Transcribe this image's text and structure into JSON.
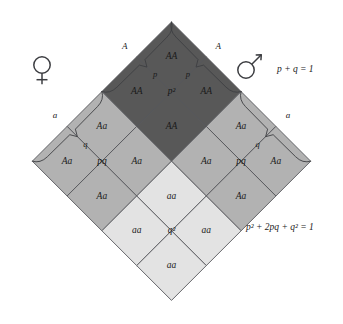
{
  "diagram": {
    "colors": {
      "dark": "#585858",
      "medium": "#b2b2b2",
      "light": "#e3e3e3",
      "stroke": "#55565a",
      "bracket": "#3d3e42",
      "text": "#1a1a1a",
      "background": "#ffffff"
    },
    "symbols": {
      "female": "female-symbol",
      "male": "male-symbol"
    },
    "equations": {
      "allele": "p + q = 1",
      "genotype": "p² + 2pq + q² = 1"
    },
    "brackets": {
      "female_p": "p",
      "female_q": "q",
      "male_p": "p",
      "male_q": "q"
    },
    "allele_labels": {
      "female_A": "A",
      "female_a": "a",
      "male_A": "A",
      "male_a": "a"
    },
    "quadrants": [
      {
        "name": "top",
        "center_label": "p²",
        "shade": "dark",
        "cells": [
          "AA",
          "AA",
          "AA",
          "AA"
        ]
      },
      {
        "name": "left",
        "center_label": "pq",
        "shade": "medium",
        "cells": [
          "Aa",
          "Aa",
          "Aa",
          "Aa"
        ]
      },
      {
        "name": "right",
        "center_label": "pq",
        "shade": "medium",
        "cells": [
          "Aa",
          "Aa",
          "Aa",
          "Aa"
        ]
      },
      {
        "name": "bottom",
        "center_label": "q²",
        "shade": "light",
        "cells": [
          "aa",
          "aa",
          "aa",
          "aa"
        ]
      }
    ],
    "grid_cells": [
      {
        "row": 0,
        "col": 0,
        "label": "AA",
        "shade": "dark"
      },
      {
        "row": 0,
        "col": 1,
        "label": "AA",
        "shade": "dark"
      },
      {
        "row": 0,
        "col": 2,
        "label": "Aa",
        "shade": "medium"
      },
      {
        "row": 0,
        "col": 3,
        "label": "Aa",
        "shade": "medium"
      },
      {
        "row": 1,
        "col": 0,
        "label": "AA",
        "shade": "dark"
      },
      {
        "row": 1,
        "col": 1,
        "label": "AA",
        "shade": "dark"
      },
      {
        "row": 1,
        "col": 2,
        "label": "Aa",
        "shade": "medium"
      },
      {
        "row": 1,
        "col": 3,
        "label": "Aa",
        "shade": "medium"
      },
      {
        "row": 2,
        "col": 0,
        "label": "Aa",
        "shade": "medium"
      },
      {
        "row": 2,
        "col": 1,
        "label": "Aa",
        "shade": "medium"
      },
      {
        "row": 2,
        "col": 2,
        "label": "aa",
        "shade": "light"
      },
      {
        "row": 2,
        "col": 3,
        "label": "aa",
        "shade": "light"
      },
      {
        "row": 3,
        "col": 0,
        "label": "Aa",
        "shade": "medium"
      },
      {
        "row": 3,
        "col": 1,
        "label": "Aa",
        "shade": "medium"
      },
      {
        "row": 3,
        "col": 2,
        "label": "aa",
        "shade": "light"
      },
      {
        "row": 3,
        "col": 3,
        "label": "aa",
        "shade": "light"
      }
    ]
  }
}
